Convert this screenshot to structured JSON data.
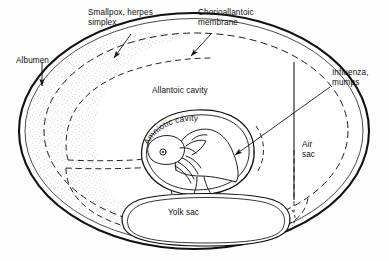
{
  "diagram": {
    "type": "anatomical-diagram",
    "background_color": "#fdfdfd",
    "ink_color": "#111111",
    "stipple_color": "#8a8a8a",
    "labels": {
      "albumen": "Albumen",
      "smallpox_herpes": "Smallpox, herpes\nsimplex",
      "chorioallantoic": "Chorioallantoic\nmembrane",
      "allantoic_cavity": "Allantoic cavity",
      "amniotic_cavity": "Amniotic cavity",
      "yolk_sac": "Yolk sac",
      "air_sac": "Air\nsac",
      "influenza_mumps": "Influenza,\nmumps"
    },
    "label_list": [
      {
        "id": "albumen",
        "text": "Albumen",
        "role": "structure",
        "pointer": "arrow-down"
      },
      {
        "id": "smallpox_herpes",
        "text": "Smallpox, herpes simplex",
        "role": "inoculation-route",
        "pointer": "arrow-down-left"
      },
      {
        "id": "chorioallantoic",
        "text": "Chorioallantoic membrane",
        "role": "structure",
        "pointer": "arrow-down-left"
      },
      {
        "id": "allantoic_cavity",
        "text": "Allantoic cavity",
        "role": "structure",
        "pointer": "none"
      },
      {
        "id": "amniotic_cavity",
        "text": "Amniotic cavity",
        "role": "structure",
        "pointer": "none"
      },
      {
        "id": "yolk_sac",
        "text": "Yolk sac",
        "role": "structure",
        "pointer": "none"
      },
      {
        "id": "air_sac",
        "text": "Air sac",
        "role": "structure",
        "pointer": "none"
      },
      {
        "id": "influenza_mumps",
        "text": "Influenza, mumps",
        "role": "inoculation-route",
        "pointer": "arrow-down-left-long"
      }
    ]
  }
}
